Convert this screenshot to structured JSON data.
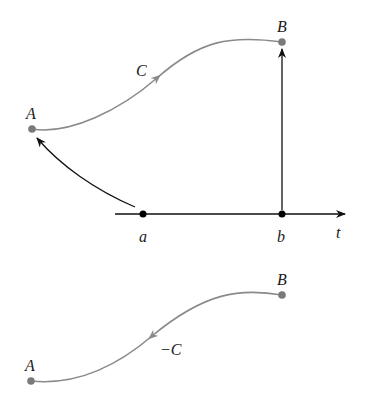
{
  "diagram": {
    "colors": {
      "curve": "#8a8a8a",
      "axis": "#111111",
      "point": "#7a7a7a",
      "axis_point": "#000000"
    },
    "top": {
      "curve_label": "C",
      "start_label": "A",
      "end_label": "B",
      "axis_label": "t",
      "axis_points": [
        "a",
        "b"
      ]
    },
    "bottom": {
      "curve_label": "−C",
      "start_label": "B",
      "end_label": "A"
    }
  }
}
